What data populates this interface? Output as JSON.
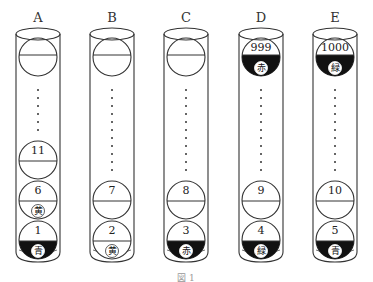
{
  "figure": {
    "caption": "図 1",
    "tubes": [
      {
        "label": "A",
        "cx": 38,
        "top_ball": {
          "number": "",
          "fill": "none",
          "color_label": ""
        },
        "dots_from": 90,
        "dots_to": 130,
        "balls": [
          {
            "number": "11",
            "cy": 160,
            "fill": "none",
            "color_label": ""
          },
          {
            "number": "6",
            "cy": 200,
            "fill": "none",
            "color_label": "黄"
          },
          {
            "number": "1",
            "cy": 240,
            "fill": "dark",
            "color_label": "青"
          }
        ]
      },
      {
        "label": "B",
        "cx": 112,
        "top_ball": {
          "number": "",
          "fill": "none",
          "color_label": ""
        },
        "dots_from": 90,
        "dots_to": 172,
        "balls": [
          {
            "number": "7",
            "cy": 200,
            "fill": "none",
            "color_label": ""
          },
          {
            "number": "2",
            "cy": 240,
            "fill": "none",
            "color_label": "黄"
          }
        ]
      },
      {
        "label": "C",
        "cx": 186,
        "top_ball": {
          "number": "",
          "fill": "none",
          "color_label": ""
        },
        "dots_from": 90,
        "dots_to": 172,
        "balls": [
          {
            "number": "8",
            "cy": 200,
            "fill": "none",
            "color_label": ""
          },
          {
            "number": "3",
            "cy": 240,
            "fill": "dark",
            "color_label": "赤"
          }
        ]
      },
      {
        "label": "D",
        "cx": 261,
        "top_ball": {
          "number": "999",
          "fill": "dark",
          "color_label": "赤"
        },
        "dots_from": 90,
        "dots_to": 172,
        "balls": [
          {
            "number": "9",
            "cy": 200,
            "fill": "none",
            "color_label": ""
          },
          {
            "number": "4",
            "cy": 240,
            "fill": "dark",
            "color_label": "緑"
          }
        ]
      },
      {
        "label": "E",
        "cx": 335,
        "top_ball": {
          "number": "1000",
          "fill": "dark",
          "color_label": "緑"
        },
        "dots_from": 90,
        "dots_to": 172,
        "balls": [
          {
            "number": "10",
            "cy": 200,
            "fill": "none",
            "color_label": ""
          },
          {
            "number": "5",
            "cy": 240,
            "fill": "dark",
            "color_label": "青"
          }
        ]
      }
    ]
  },
  "colors": {
    "stroke": "#333333",
    "dark_fill": "#111111",
    "background": "#ffffff"
  }
}
